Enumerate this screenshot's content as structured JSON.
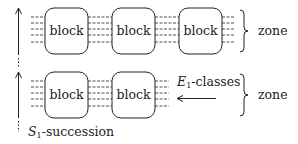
{
  "diagram": {
    "rows": [
      {
        "id": "top-row",
        "blocks": [
          {
            "label": "block",
            "x": 45,
            "y": 8,
            "w": 43,
            "h": 46
          },
          {
            "label": "block",
            "x": 112,
            "y": 8,
            "w": 43,
            "h": 46
          },
          {
            "label": "block",
            "x": 179,
            "y": 8,
            "w": 43,
            "h": 46
          }
        ],
        "brace_label": "zone"
      },
      {
        "id": "bottom-row",
        "blocks": [
          {
            "label": "block",
            "x": 45,
            "y": 72,
            "w": 43,
            "h": 46
          },
          {
            "label": "block",
            "x": 112,
            "y": 72,
            "w": 43,
            "h": 46
          }
        ],
        "brace_label": "zone"
      }
    ],
    "annotations": {
      "classes_label_main": "E",
      "classes_label_sub": "1",
      "classes_label_rest": "-classes",
      "succession_label_main": "S",
      "succession_label_sub": "1",
      "succession_label_rest": "-succession"
    },
    "colors": {
      "stroke": "#222222",
      "background": "#ffffff"
    }
  }
}
